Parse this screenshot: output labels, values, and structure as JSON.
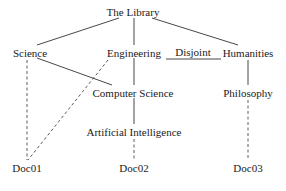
{
  "diagram": {
    "nodes": {
      "root": {
        "label": "The Library",
        "x": 133,
        "y": 6
      },
      "science": {
        "label": "Science",
        "x": 30,
        "y": 47
      },
      "engineering": {
        "label": "Engineering",
        "x": 134,
        "y": 47
      },
      "humanities": {
        "label": "Humanities",
        "x": 248,
        "y": 47
      },
      "computer_science": {
        "label": "Computer Science",
        "x": 133,
        "y": 87
      },
      "philosophy": {
        "label": "Philosophy",
        "x": 248,
        "y": 87
      },
      "ai": {
        "label": "Artificial Intelligence",
        "x": 134,
        "y": 126
      },
      "doc01": {
        "label": "Doc01",
        "x": 27,
        "y": 162
      },
      "doc02": {
        "label": "Doc02",
        "x": 134,
        "y": 162
      },
      "doc03": {
        "label": "Doc03",
        "x": 248,
        "y": 162
      }
    },
    "relation_label": "Disjoint",
    "edges_solid": [
      [
        "root",
        "science"
      ],
      [
        "root",
        "engineering"
      ],
      [
        "root",
        "humanities"
      ],
      [
        "science",
        "computer_science"
      ],
      [
        "engineering",
        "computer_science"
      ],
      [
        "computer_science",
        "ai"
      ],
      [
        "humanities",
        "philosophy"
      ],
      [
        "engineering",
        "humanities",
        "disjoint"
      ]
    ],
    "edges_dashed": [
      [
        "science",
        "doc01"
      ],
      [
        "engineering",
        "doc01"
      ],
      [
        "ai",
        "doc02"
      ],
      [
        "philosophy",
        "doc03"
      ]
    ],
    "caption": ""
  }
}
